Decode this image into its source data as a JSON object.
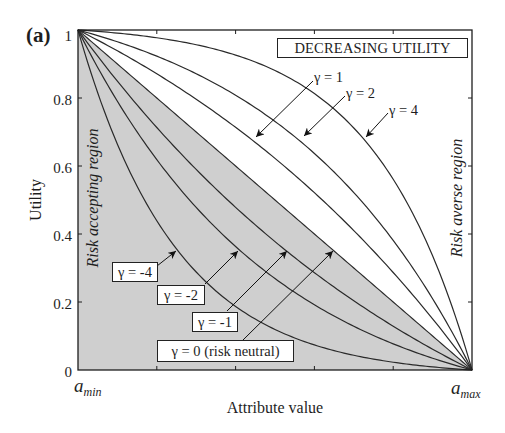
{
  "figure": {
    "panel_label": "(a)"
  },
  "chart_data": {
    "type": "line",
    "title": "DECREASING UTILITY",
    "xlabel": "Attribute value",
    "ylabel": "Utility",
    "xlim": [
      0,
      1
    ],
    "ylim": [
      0,
      1
    ],
    "x_end_labels": [
      {
        "base": "a",
        "sub": "min"
      },
      {
        "base": "a",
        "sub": "max"
      }
    ],
    "xticks_fraction": [
      0.2,
      0.4,
      0.6,
      0.8
    ],
    "yticks": [
      0,
      0.2,
      0.4,
      0.6,
      0.8,
      1
    ],
    "ytick_labels": [
      "0",
      "0.2",
      "0.4",
      "0.6",
      "0.8",
      "1"
    ],
    "grid": false,
    "shaded_region": "area below the γ = 0 (risk neutral) line",
    "regions": {
      "accepting": "Risk accepting region",
      "averse": "Risk averse region"
    },
    "x": [
      0,
      0.1,
      0.2,
      0.3,
      0.4,
      0.5,
      0.6,
      0.7,
      0.8,
      0.9,
      1
    ],
    "series": [
      {
        "name": "gamma_4",
        "label": "γ = 4",
        "gamma": 4,
        "values": [
          1,
          0.9908,
          0.9771,
          0.9567,
          0.9262,
          0.8808,
          0.813,
          0.7118,
          0.5609,
          0.3358,
          0
        ]
      },
      {
        "name": "gamma_2",
        "label": "γ = 2",
        "gamma": 2,
        "values": [
          1,
          0.9654,
          0.923,
          0.8713,
          0.8082,
          0.7311,
          0.6369,
          0.5218,
          0.3813,
          0.2096,
          0
        ]
      },
      {
        "name": "gamma_1",
        "label": "γ = 1",
        "gamma": 1,
        "values": [
          1,
          0.9388,
          0.8711,
          0.7964,
          0.7138,
          0.6225,
          0.5215,
          0.41,
          0.2868,
          0.1505,
          0
        ]
      },
      {
        "name": "gamma_0",
        "label": "γ = 0 (risk neutral)",
        "gamma": 0,
        "values": [
          1,
          0.9,
          0.8,
          0.7,
          0.6,
          0.5,
          0.4,
          0.3,
          0.2,
          0.1,
          0
        ]
      },
      {
        "name": "gamma_m1",
        "label": "γ = -1",
        "gamma": -1,
        "values": [
          1,
          0.8495,
          0.7132,
          0.59,
          0.4785,
          0.3775,
          0.2862,
          0.2036,
          0.1289,
          0.0612,
          0
        ]
      },
      {
        "name": "gamma_m2",
        "label": "γ = -2",
        "gamma": -2,
        "values": [
          1,
          0.7904,
          0.6187,
          0.4782,
          0.3631,
          0.2689,
          0.1918,
          0.1287,
          0.077,
          0.0346,
          0
        ]
      },
      {
        "name": "gamma_m4",
        "label": "γ = -4",
        "gamma": -4,
        "values": [
          1,
          0.6642,
          0.4391,
          0.2882,
          0.187,
          0.1192,
          0.0738,
          0.0433,
          0.0229,
          0.0092,
          0
        ]
      }
    ],
    "colors": {
      "line": "#2a2a2a",
      "frame": "#1e1e1e",
      "shade": "#cfcfcf"
    }
  }
}
